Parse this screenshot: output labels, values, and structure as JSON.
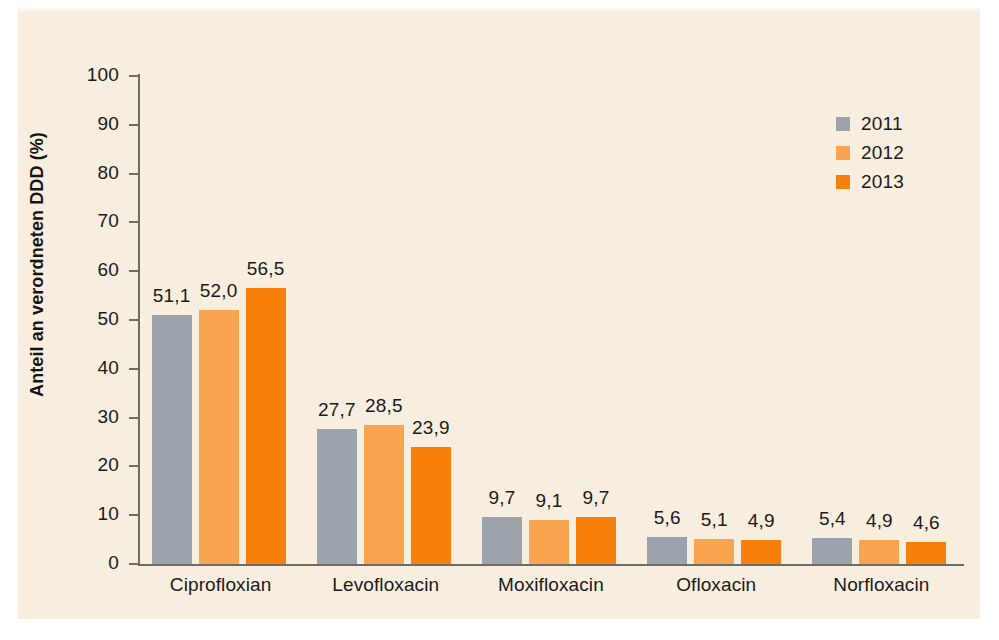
{
  "chart_data": {
    "type": "bar",
    "title": "",
    "subtitle": "",
    "xlabel": "",
    "ylabel": "Anteil an verordneten DDD (%)",
    "ylim": [
      0,
      100
    ],
    "ytick_step": 10,
    "yticks": [
      "100",
      "90",
      "80",
      "70",
      "60",
      "50",
      "40",
      "30",
      "20",
      "10",
      "0"
    ],
    "grid": false,
    "legend_position": "top-right",
    "categories": [
      "Ciprofloxian",
      "Levofloxacin",
      "Moxifloxacin",
      "Ofloxacin",
      "Norfloxacin"
    ],
    "series": [
      {
        "name": "2011",
        "color": "#9ba4ad",
        "values": [
          51.1,
          27.7,
          9.7,
          5.6,
          5.4
        ],
        "labels": [
          "51,1",
          "27,7",
          "9,7",
          "5,6",
          "5,4"
        ]
      },
      {
        "name": "2012",
        "color": "#f9a44f",
        "values": [
          52.0,
          28.5,
          9.1,
          5.1,
          4.9
        ],
        "labels": [
          "52,0",
          "28,5",
          "9,1",
          "5,1",
          "4,9"
        ]
      },
      {
        "name": "2013",
        "color": "#f7800a",
        "values": [
          56.5,
          23.9,
          9.7,
          4.9,
          4.6
        ],
        "labels": [
          "56,5",
          "23,9",
          "9,7",
          "4,9",
          "4,6"
        ]
      }
    ]
  },
  "legend": {
    "items": [
      {
        "label": "2011",
        "color": "#9ba4ad"
      },
      {
        "label": "2012",
        "color": "#f9a44f"
      },
      {
        "label": "2013",
        "color": "#f7800a"
      }
    ]
  },
  "colors": {
    "background": "#f7eedf",
    "axis": "#6e6a66",
    "text": "#1b1a19",
    "series_2011": "#9ba4ad",
    "series_2012": "#f9a44f",
    "series_2013": "#f7800a"
  }
}
